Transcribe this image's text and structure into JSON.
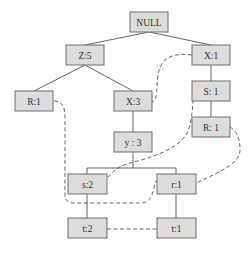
{
  "diagram": {
    "type": "fp-tree",
    "nodes": [
      {
        "id": "null",
        "label": "NULL",
        "x": 130,
        "y": 12,
        "w": 38,
        "h": 20
      },
      {
        "id": "z5",
        "label": "Z:5",
        "x": 66,
        "y": 45,
        "w": 38,
        "h": 20
      },
      {
        "id": "x1",
        "label": "X:1",
        "x": 192,
        "y": 45,
        "w": 38,
        "h": 20
      },
      {
        "id": "r1a",
        "label": "R:1",
        "x": 15,
        "y": 91,
        "w": 38,
        "h": 20
      },
      {
        "id": "x3",
        "label": "X:3",
        "x": 114,
        "y": 91,
        "w": 38,
        "h": 20
      },
      {
        "id": "s1",
        "label": "S: 1",
        "x": 192,
        "y": 81,
        "w": 38,
        "h": 20
      },
      {
        "id": "r1b",
        "label": "R: 1",
        "x": 192,
        "y": 117,
        "w": 38,
        "h": 20
      },
      {
        "id": "y3",
        "label": "y : 3",
        "x": 114,
        "y": 132,
        "w": 38,
        "h": 20
      },
      {
        "id": "s2",
        "label": "s:2",
        "x": 68,
        "y": 174,
        "w": 39,
        "h": 20
      },
      {
        "id": "r1c",
        "label": "r:1",
        "x": 157,
        "y": 174,
        "w": 39,
        "h": 20
      },
      {
        "id": "t2",
        "label": "t:2",
        "x": 68,
        "y": 218,
        "w": 39,
        "h": 20
      },
      {
        "id": "t1",
        "label": "t:1",
        "x": 157,
        "y": 218,
        "w": 39,
        "h": 20
      }
    ],
    "tree_edges": [
      [
        "null",
        "z5"
      ],
      [
        "null",
        "x1"
      ],
      [
        "z5",
        "r1a"
      ],
      [
        "z5",
        "x3"
      ],
      [
        "x1",
        "s1"
      ],
      [
        "s1",
        "r1b"
      ],
      [
        "x3",
        "y3"
      ],
      [
        "y3",
        "s2"
      ],
      [
        "y3",
        "r1c"
      ],
      [
        "s2",
        "t2"
      ],
      [
        "r1c",
        "t1"
      ]
    ],
    "node_links": [
      {
        "from": "x1",
        "to": "x3",
        "item": "X"
      },
      {
        "from": "r1a",
        "to": "r1c",
        "item": "R"
      },
      {
        "from": "s1",
        "to": "s2",
        "item": "S"
      },
      {
        "from": "r1b",
        "to": "r1c",
        "item": "R"
      },
      {
        "from": "t2",
        "to": "t1",
        "item": "T"
      }
    ]
  }
}
